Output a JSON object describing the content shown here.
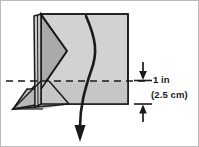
{
  "figure": {
    "canvas": {
      "width": 199,
      "height": 147,
      "background": "#ffffff",
      "border_color": "#b9b9b9"
    },
    "colors": {
      "face_light": "#d2d2d2",
      "face_mid": "#c2c2c2",
      "face_dark": "#a8a8a8",
      "outline": "#1a1a1a",
      "curve": "#1a1a1a",
      "dashed_line": "#1a1a1a",
      "text": "#1a1a1a"
    },
    "dimension": {
      "primary_label": "1 in",
      "secondary_label": "(2.5 cm)",
      "value": 1,
      "unit": "in",
      "metric_value": 2.5,
      "metric_unit": "cm",
      "top_arrow_direction": "down",
      "bottom_arrow_direction": "up"
    },
    "annotations": {
      "reference_line_style": "dashed",
      "drop_path_arrow_direction": "down"
    }
  }
}
